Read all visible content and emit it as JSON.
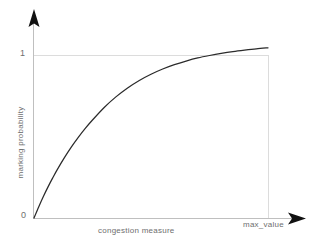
{
  "chart_data": {
    "type": "line",
    "title": "",
    "subtitle": "",
    "xlabel": "congestion measure",
    "ylabel": "marking probability",
    "xlim": [
      0,
      1
    ],
    "ylim": [
      0,
      1.08
    ],
    "grid": true,
    "legend": null,
    "legend_position": "none",
    "x_tick_labels": [
      "0",
      "max_value"
    ],
    "x_tick_values": [
      0,
      1
    ],
    "y_tick_labels": [
      "0",
      "1"
    ],
    "y_tick_values": [
      0,
      1
    ],
    "annotations": [],
    "series": [
      {
        "name": "marking probability",
        "color": "#2b2b2b",
        "x": [
          0.0,
          0.02,
          0.04,
          0.06,
          0.08,
          0.1,
          0.13,
          0.16,
          0.19,
          0.22,
          0.25,
          0.3,
          0.35,
          0.4,
          0.45,
          0.5,
          0.55,
          0.6,
          0.65,
          0.7,
          0.75,
          0.8,
          0.85,
          0.9,
          0.95,
          1.0
        ],
        "y": [
          0.0,
          0.068,
          0.132,
          0.191,
          0.246,
          0.298,
          0.37,
          0.436,
          0.496,
          0.551,
          0.601,
          0.678,
          0.743,
          0.798,
          0.844,
          0.882,
          0.914,
          0.941,
          0.963,
          0.982,
          0.997,
          1.01,
          1.021,
          1.03,
          1.038,
          1.044
        ]
      }
    ]
  },
  "axes": {
    "y_axis_tick_one": "1",
    "y_axis_tick_zero": "0",
    "y_axis_title": "marking probability",
    "x_axis_title": "congestion measure",
    "x_axis_tick_max": "max_value"
  },
  "colors": {
    "curve": "#2b2b2b",
    "axis": "#b9b9b9",
    "gridline": "#dcdcdc",
    "arrow": "#111111",
    "label_text": "#6e6e6e",
    "background": "#ffffff"
  }
}
